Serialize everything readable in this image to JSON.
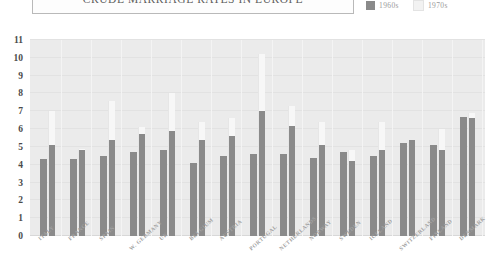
{
  "header": {
    "title": "CRUDE MARRIAGE RATES IN EUROPE"
  },
  "legend": {
    "position": "top-right",
    "items": [
      {
        "label": "1960s",
        "color": "#8a8a8a"
      },
      {
        "label": "1970s",
        "color": "#f2f2f2"
      }
    ]
  },
  "colors": {
    "plot_background": "#ebebeb",
    "series_1960s": "#8a8a8a",
    "series_1970s": "#f7f7f7",
    "axis_text": "#4a4a4a",
    "tick_label": "#a2a2a2",
    "title_text": "#5d5d5d"
  },
  "chart_data": {
    "type": "bar",
    "title": "CRUDE MARRIAGE RATES IN EUROPE",
    "xlabel": "",
    "ylabel": "",
    "ylim": [
      0,
      11
    ],
    "yticks": [
      0,
      1,
      2,
      3,
      4,
      5,
      6,
      7,
      8,
      9,
      10,
      11
    ],
    "grid": true,
    "legend_position": "top-right",
    "categories": [
      "ITALY",
      "FRANCE",
      "SPAIN",
      "W. GERMANY",
      "UK",
      "BELGIUM",
      "AUSTRIA",
      "PORTUGAL",
      "NETHERLANDS",
      "NORWAY",
      "SWEDEN",
      "ICELAND",
      "SWITZERLAND",
      "FINLAND",
      "DENMARK"
    ],
    "series": [
      {
        "name": "1960s",
        "color": "#8a8a8a",
        "values": [
          4.3,
          4.3,
          4.5,
          4.7,
          4.8,
          4.1,
          4.5,
          4.6,
          4.6,
          4.4,
          4.7,
          4.5,
          5.2,
          5.1,
          6.7
        ]
      },
      {
        "name": "1970s",
        "color": "#f7f7f7",
        "values": [
          5.1,
          4.8,
          5.4,
          5.7,
          5.9,
          5.4,
          5.6,
          7.0,
          6.2,
          5.1,
          4.2,
          4.8,
          5.4,
          4.8,
          6.6
        ]
      }
    ],
    "series_secondary_peaks": [
      {
        "name": "1970s",
        "values": [
          7.0,
          4.9,
          7.6,
          6.1,
          8.0,
          6.4,
          6.6,
          10.2,
          7.3,
          6.4,
          4.8,
          6.4,
          5.3,
          6.0,
          6.9
        ]
      }
    ]
  }
}
